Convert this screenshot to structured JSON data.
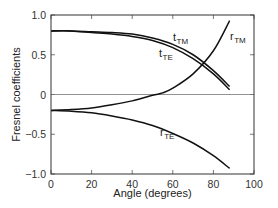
{
  "chart_data": {
    "type": "line",
    "title": "",
    "xlabel": "Angle (degrees)",
    "ylabel": "Fresnel coefficients",
    "xlim": [
      0,
      100
    ],
    "ylim": [
      -1.0,
      1.0
    ],
    "x_ticks": [
      0,
      20,
      40,
      60,
      80,
      100
    ],
    "x_tick_labels": [
      "0",
      "20",
      "40",
      "60",
      "80",
      "100"
    ],
    "y_ticks": [
      -1.0,
      -0.5,
      0,
      0.5,
      1.0
    ],
    "y_tick_labels": [
      "−1.0",
      "−0.5",
      "0",
      "0.5",
      "1.0"
    ],
    "grid": false,
    "zero_line": true,
    "legend": "inline labels",
    "series": [
      {
        "name": "t_TM",
        "label_main": "t",
        "label_sub": "TM",
        "x": [
          0,
          10,
          20,
          30,
          40,
          50,
          60,
          70,
          80,
          88
        ],
        "values": [
          0.8,
          0.8,
          0.79,
          0.78,
          0.76,
          0.71,
          0.63,
          0.5,
          0.3,
          0.1
        ]
      },
      {
        "name": "t_TE",
        "label_main": "t",
        "label_sub": "TE",
        "x": [
          0,
          10,
          20,
          30,
          40,
          50,
          60,
          70,
          80,
          88
        ],
        "values": [
          0.8,
          0.8,
          0.78,
          0.76,
          0.73,
          0.68,
          0.59,
          0.45,
          0.26,
          0.06
        ]
      },
      {
        "name": "r_TM",
        "label_main": "r",
        "label_sub": "TM",
        "x": [
          0,
          10,
          20,
          30,
          40,
          50,
          55,
          60,
          70,
          80,
          88
        ],
        "values": [
          -0.2,
          -0.19,
          -0.17,
          -0.13,
          -0.08,
          -0.01,
          0.02,
          0.08,
          0.26,
          0.55,
          0.93
        ]
      },
      {
        "name": "r_TE",
        "label_main": "r",
        "label_sub": "TE",
        "x": [
          0,
          10,
          20,
          30,
          40,
          50,
          60,
          70,
          80,
          88
        ],
        "values": [
          -0.2,
          -0.21,
          -0.23,
          -0.27,
          -0.32,
          -0.39,
          -0.49,
          -0.61,
          -0.77,
          -0.93
        ]
      }
    ]
  }
}
